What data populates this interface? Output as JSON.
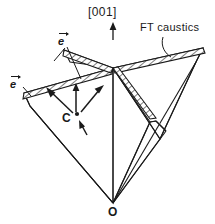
{
  "figure": {
    "name": "ft-caustics-diagram",
    "background_color": "#ffffff",
    "ink_color": "#1a1a1a",
    "width": 215,
    "height": 224
  },
  "labels": {
    "axis_direction": "[001]",
    "caustics": "FT caustics",
    "point_c": "C",
    "origin": "O",
    "polarization_vector_1": "e",
    "polarization_vector_2": "e"
  },
  "geometry": {
    "origin_point": [
      113,
      203
    ],
    "crossing_point": [
      113,
      68
    ],
    "point_c": [
      76,
      117
    ],
    "axis_arrow": {
      "from": [
        113,
        40
      ],
      "to": [
        113,
        24
      ]
    },
    "caustic_bands": 4,
    "hatch_angle_deg": 45,
    "ray_arrows": [
      {
        "from": [
          74,
          113
        ],
        "to": [
          47,
          88
        ]
      },
      {
        "from": [
          76,
          112
        ],
        "to": [
          76,
          83
        ]
      },
      {
        "from": [
          80,
          112
        ],
        "to": [
          103,
          83
        ]
      },
      {
        "from": [
          80,
          124
        ],
        "to": [
          88,
          135
        ]
      }
    ],
    "leader_lines": [
      {
        "from": [
          66,
          46
        ],
        "to": [
          80,
          80
        ]
      },
      {
        "from": [
          64,
          47
        ],
        "to": [
          53,
          62
        ]
      },
      {
        "from": [
          24,
          88
        ],
        "to": [
          30,
          96
        ]
      },
      {
        "from": [
          163,
          36
        ],
        "to": [
          170,
          56
        ]
      }
    ]
  }
}
